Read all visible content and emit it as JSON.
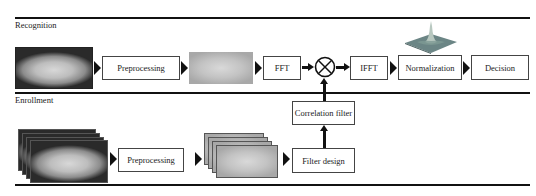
{
  "sections": {
    "recognition": {
      "label": "Recognition"
    },
    "enrollment": {
      "label": "Enrollment"
    }
  },
  "recognition_flow": {
    "preprocessing": "Preprocessing",
    "fft": "FFT",
    "multiply_symbol": "⊗",
    "ifft": "IFFT",
    "normalization": "Normalization",
    "decision": "Decision"
  },
  "enrollment_flow": {
    "preprocessing": "Preprocessing",
    "filter_design": "Filter design",
    "correlation_filter": "Correlation filter"
  },
  "colors": {
    "line": "#111111",
    "box_border": "#444444",
    "peak_surface": "#5f7f7f"
  }
}
